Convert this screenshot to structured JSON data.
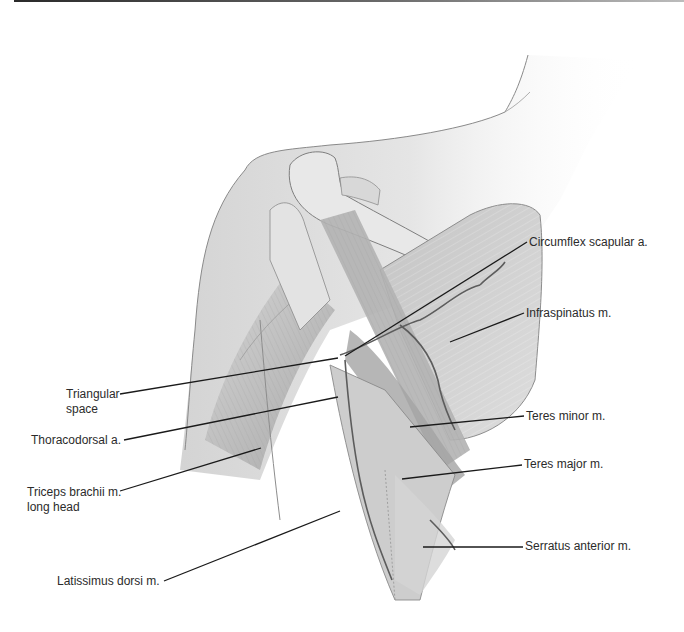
{
  "figure": {
    "colors": {
      "label_text": "#2b2b2b",
      "leader_line": "#1a1a1a",
      "skin_fill": "#dedede",
      "muscle_fill": "#bdbdbd",
      "bone_fill": "#e6e6e6",
      "vessel": "#5c5c5c"
    }
  },
  "labels": {
    "circumflex_scapular": "Circumflex scapular a.",
    "infraspinatus": "Infraspinatus m.",
    "teres_minor": "Teres minor m.",
    "teres_major": "Teres major m.",
    "serratus_anterior": "Serratus anterior m.",
    "triangular_space_1": "Triangular",
    "triangular_space_2": "space",
    "thoracodorsal": "Thoracodorsal a.",
    "triceps_1": "Triceps brachii m.",
    "triceps_2": "long head",
    "latissimus": "Latissimus dorsi m."
  }
}
